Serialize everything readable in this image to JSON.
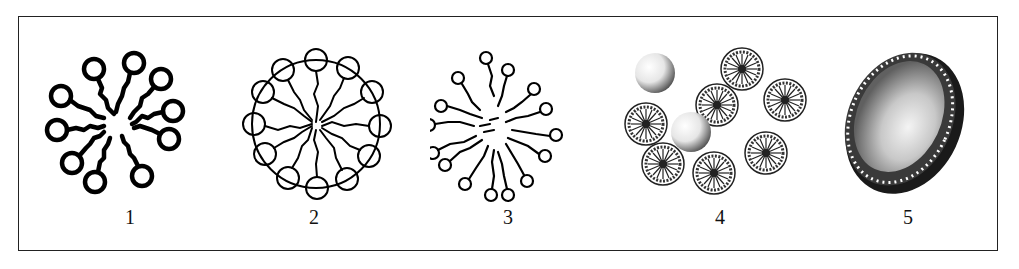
{
  "figure": {
    "panels": [
      {
        "id": 1,
        "label": "1",
        "description": "micelle with thick wavy tails and circular heads"
      },
      {
        "id": 2,
        "label": "2",
        "description": "micelle with circular heads arranged on outer ring, tails to center"
      },
      {
        "id": 3,
        "label": "3",
        "description": "radial micelle with small circular heads and long wavy tails"
      },
      {
        "id": 4,
        "label": "4",
        "description": "cluster of micelles and shaded spheres"
      },
      {
        "id": 5,
        "label": "5",
        "description": "shaded vesicle / liposome with bilayer edge"
      }
    ]
  }
}
